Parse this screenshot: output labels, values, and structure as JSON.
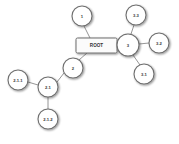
{
  "diagram": {
    "type": "tree / mind-map",
    "root": {
      "id": "root",
      "label": "ROOT",
      "shape": "rounded-rectangle",
      "x": 76,
      "y": 38,
      "w": 41,
      "h": 15
    },
    "nodes": [
      {
        "id": "n1",
        "label": "1",
        "cx": 82,
        "cy": 16,
        "r": 10
      },
      {
        "id": "n2",
        "label": "2",
        "cx": 73,
        "cy": 68,
        "r": 10
      },
      {
        "id": "n3",
        "label": "3",
        "cx": 128,
        "cy": 45,
        "r": 11
      },
      {
        "id": "n31",
        "label": "3.1",
        "cx": 144,
        "cy": 74,
        "r": 10
      },
      {
        "id": "n32",
        "label": "3.2",
        "cx": 159,
        "cy": 43,
        "r": 10
      },
      {
        "id": "n33",
        "label": "3.3",
        "cx": 136,
        "cy": 15,
        "r": 10
      },
      {
        "id": "n21",
        "label": "2.1",
        "cx": 48,
        "cy": 87,
        "r": 10
      },
      {
        "id": "n211",
        "label": "2.1.1",
        "cx": 18,
        "cy": 80,
        "r": 10
      },
      {
        "id": "n212",
        "label": "2.1.2",
        "cx": 48,
        "cy": 119,
        "r": 10
      }
    ],
    "edges": [
      {
        "from": "root",
        "to": "n1",
        "x1": 90,
        "y1": 38,
        "x2": 84,
        "y2": 26
      },
      {
        "from": "root",
        "to": "n2",
        "x1": 87,
        "y1": 53,
        "x2": 79,
        "y2": 60
      },
      {
        "from": "root",
        "to": "n3",
        "x1": 117,
        "y1": 45,
        "x2": 117,
        "y2": 45
      },
      {
        "from": "n3",
        "to": "n31",
        "x1": 133,
        "y1": 55,
        "x2": 140,
        "y2": 65
      },
      {
        "from": "n3",
        "to": "n32",
        "x1": 139,
        "y1": 44,
        "x2": 149,
        "y2": 43
      },
      {
        "from": "n3",
        "to": "n33",
        "x1": 131,
        "y1": 34,
        "x2": 134,
        "y2": 25
      },
      {
        "from": "n2",
        "to": "n21",
        "x1": 64,
        "y1": 73,
        "x2": 57,
        "y2": 82
      },
      {
        "from": "n21",
        "to": "n211",
        "x1": 38,
        "y1": 85,
        "x2": 28,
        "y2": 82
      },
      {
        "from": "n21",
        "to": "n212",
        "x1": 48,
        "y1": 97,
        "x2": 48,
        "y2": 109
      }
    ]
  },
  "colors": {
    "node_fill": "#ffffff",
    "node_stroke": "#6e6e6e",
    "edge": "#7a7a7a",
    "label": "#333333",
    "background": "#ffffff"
  }
}
